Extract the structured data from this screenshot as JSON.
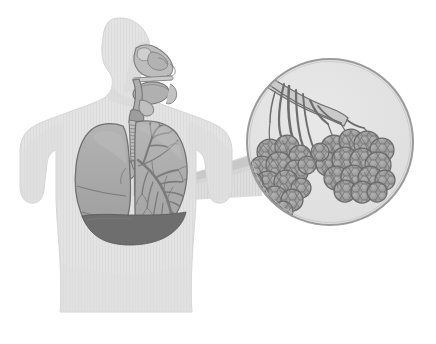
{
  "figure": {
    "title": "Human Respiratory System with Magnified Alveoli",
    "background_color": "#ffffff",
    "width": 436,
    "height": 344
  },
  "palette": {
    "background": "#ffffff",
    "body_silhouette": "#e2e2e2",
    "body_silhouette_stripe": "#dadada",
    "body_outline": "#d2d2d2",
    "head_shadow": "#d8d8d8",
    "airway_light": "#c3c3c3",
    "airway_mid": "#a9a9a9",
    "airway_dark": "#8e8e8e",
    "outline_dark": "#6f6f6f",
    "outline_mid": "#868686",
    "lung_fill": "#a8a8a8",
    "lung_fill_light": "#b4b4b4",
    "lung_outline": "#717171",
    "bronchial_tree": "#7b7b7b",
    "trachea_fill": "#bdbdbd",
    "trachea_ring": "#8a8a8a",
    "diaphragm": "#6e6e6e",
    "cone_fill": "#dedede",
    "cone_fill_dark": "#cfcfcf",
    "magnifier_fill": "#e3e3e3",
    "magnifier_border": "#9a9a9a",
    "alveoli_fill": "#9e9e9e",
    "alveoli_fill_light": "#b0b0b0",
    "alveoli_outline": "#6a6a6a",
    "bronchiole_fill": "#b8b8b8",
    "bronchiole_outline": "#6d6d6d"
  },
  "parts": {
    "body": {
      "label": "Human torso silhouette",
      "view": "three-quarter profile facing right"
    },
    "head": {
      "label": "Head and neck in profile"
    },
    "nasal_cavity": {
      "label": "Nasal cavity"
    },
    "oral_cavity": {
      "label": "Oral cavity and tongue"
    },
    "pharynx": {
      "label": "Pharynx"
    },
    "larynx": {
      "label": "Larynx"
    },
    "trachea": {
      "label": "Trachea",
      "cartilage_ring_count": 14
    },
    "bronchi": {
      "label": "Primary bronchi"
    },
    "left_lung": {
      "label": "Left lung (viewer right) with bronchial tree",
      "lobes": 2,
      "shows_bronchial_tree": true
    },
    "right_lung": {
      "label": "Right lung (viewer left), solid",
      "lobes": 3,
      "shows_bronchial_tree": false
    },
    "diaphragm": {
      "label": "Diaphragm"
    },
    "magnifier": {
      "label": "Magnified view of alveoli",
      "shape": "circle",
      "center_x": 330,
      "center_y": 142,
      "radius": 84
    },
    "callout_cone": {
      "label": "Callout cone from lung to magnified view"
    },
    "alveoli_clusters": [
      {
        "label": "Left alveoli cluster",
        "sac_count": 22
      },
      {
        "label": "Right alveoli cluster",
        "sac_count": 16
      }
    ],
    "bronchioles": {
      "label": "Terminal bronchioles feeding alveolar sacs",
      "branch_count": 7
    }
  }
}
